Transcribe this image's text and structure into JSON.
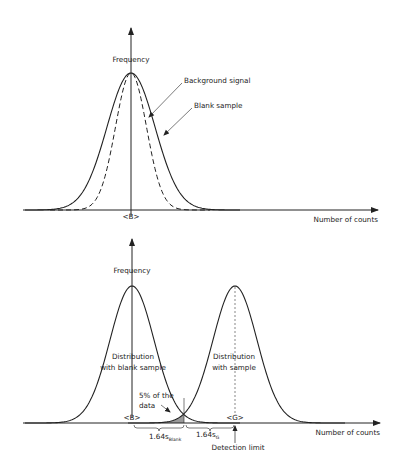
{
  "top_panel": {
    "y_axis_label": "Frequency",
    "x_axis_label": "Number of counts",
    "mean_label": "<B>",
    "annotations": {
      "background_signal": "Background signal",
      "blank_sample": "Blank sample"
    }
  },
  "bottom_panel": {
    "y_axis_label": "Frequency",
    "x_axis_label": "Number of counts",
    "blank_distribution_label_line1": "Distribution",
    "blank_distribution_label_line2": "with blank sample",
    "sample_distribution_label_line1": "Distribution",
    "sample_distribution_label_line2": "with sample",
    "mean_blank_label": "<B>",
    "mean_sample_label": "<G>",
    "tail_label_line1": "5% of the",
    "tail_label_line2": "data",
    "interval_blank_label": "1.64s",
    "interval_blank_sub": "Blank",
    "interval_sample_label": "1.64s",
    "interval_sample_sub": "G",
    "detection_limit_label": "Detection limit"
  },
  "chart_data": [
    {
      "type": "line",
      "title": "",
      "xlabel": "Number of counts",
      "ylabel": "Frequency",
      "series": [
        {
          "name": "Background signal",
          "shape": "gaussian",
          "mean": "<B>",
          "relative_width": 1.0,
          "style": "solid"
        },
        {
          "name": "Blank sample",
          "shape": "gaussian",
          "mean": "<B>",
          "relative_width": 0.65,
          "style": "dashed"
        }
      ]
    },
    {
      "type": "line",
      "title": "",
      "xlabel": "Number of counts",
      "ylabel": "Frequency",
      "series": [
        {
          "name": "Distribution with blank sample",
          "shape": "gaussian",
          "mean": "<B>",
          "style": "solid"
        },
        {
          "name": "Distribution with sample",
          "shape": "gaussian",
          "mean": "<G>",
          "style": "solid"
        }
      ],
      "shaded_region": "5% of the data",
      "intervals": [
        "1.64s_Blank",
        "1.64s_G"
      ],
      "marker": "Detection limit"
    }
  ]
}
